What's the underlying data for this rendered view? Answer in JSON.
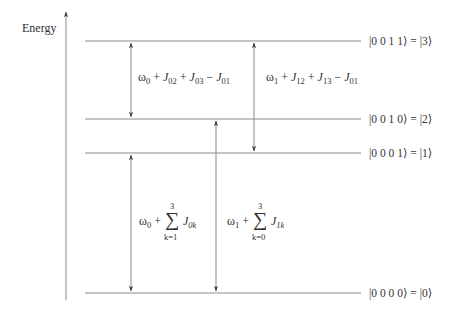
{
  "axis": {
    "label": "Energy"
  },
  "levels": [
    {
      "ket": "|0 0 1 1⟩ = |3⟩",
      "y": 41
    },
    {
      "ket": "|0 0 1 0⟩ = |2⟩",
      "y": 119
    },
    {
      "ket": "|0 0 0 1⟩ = |1⟩",
      "y": 153
    },
    {
      "ket": "|0 0 0 0⟩ = |0⟩",
      "y": 293
    }
  ],
  "transitions": {
    "t23": {
      "omega": "ω",
      "omega_sub": "0",
      "terms": [
        {
          "op": " + ",
          "sym": "J",
          "sub": "02"
        },
        {
          "op": " + ",
          "sym": "J",
          "sub": "03"
        },
        {
          "op": " − ",
          "sym": "J",
          "sub": "01"
        }
      ]
    },
    "t13": {
      "omega": "ω",
      "omega_sub": "1",
      "terms": [
        {
          "op": " + ",
          "sym": "J",
          "sub": "12"
        },
        {
          "op": " + ",
          "sym": "J",
          "sub": "13"
        },
        {
          "op": " − ",
          "sym": "J",
          "sub": "01"
        }
      ]
    },
    "t01": {
      "omega": "ω",
      "omega_sub": "0",
      "plus": " + ",
      "sigma": "∑",
      "upper": "3",
      "lower": "k=1",
      "sym": "J",
      "sub": "0k"
    },
    "t02": {
      "omega": "ω",
      "omega_sub": "1",
      "plus": " + ",
      "sigma": "∑",
      "upper": "3",
      "lower": "k=0",
      "sym": "J",
      "sub": "1k"
    }
  },
  "colors": {
    "line": "#8a8a8a",
    "arrowhead": "#333333",
    "text": "#333333"
  }
}
